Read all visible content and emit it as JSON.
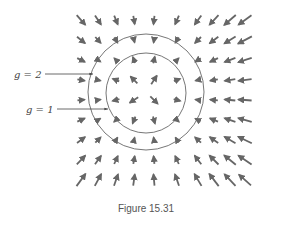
{
  "figure": {
    "caption": "Figure 15.31",
    "labels": [
      {
        "text": "g = 2",
        "x": 44,
        "y": 74,
        "arrow_to_x": 93
      },
      {
        "text": "g = 1",
        "x": 56,
        "y": 109,
        "arrow_to_x": 108
      }
    ],
    "circles": [
      {
        "name": "outer-circle",
        "cx": 146,
        "cy": 92,
        "r": 58
      },
      {
        "name": "inner-circle",
        "cx": 146,
        "cy": 93,
        "r": 40
      }
    ],
    "grid": {
      "columns_x": [
        81,
        98,
        116,
        134,
        154,
        177,
        198,
        214,
        230,
        245
      ],
      "rows_y": [
        20,
        40,
        60,
        80,
        100,
        120,
        140,
        160,
        180
      ]
    },
    "arrow_color": "#666666",
    "line_color": "#777777"
  }
}
